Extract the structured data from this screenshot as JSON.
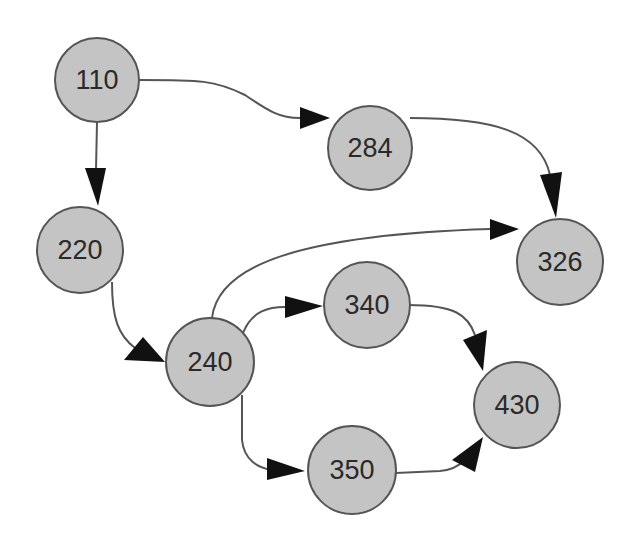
{
  "diagram": {
    "type": "directed-graph",
    "node_fill": "#c4c4c4",
    "node_stroke": "#555555",
    "arrow_color": "#111111",
    "nodes": [
      {
        "id": "n110",
        "label": "110",
        "cx": 97,
        "cy": 80,
        "r": 42
      },
      {
        "id": "n284",
        "label": "284",
        "cx": 370,
        "cy": 148,
        "r": 42
      },
      {
        "id": "n220",
        "label": "220",
        "cx": 80,
        "cy": 250,
        "r": 43
      },
      {
        "id": "n326",
        "label": "326",
        "cx": 560,
        "cy": 262,
        "r": 43
      },
      {
        "id": "n340",
        "label": "340",
        "cx": 367,
        "cy": 305,
        "r": 43
      },
      {
        "id": "n240",
        "label": "240",
        "cx": 210,
        "cy": 362,
        "r": 44
      },
      {
        "id": "n430",
        "label": "430",
        "cx": 517,
        "cy": 405,
        "r": 43
      },
      {
        "id": "n350",
        "label": "350",
        "cx": 352,
        "cy": 470,
        "r": 44
      }
    ],
    "edges": [
      {
        "from": "110",
        "to": "284"
      },
      {
        "from": "110",
        "to": "220"
      },
      {
        "from": "284",
        "to": "326"
      },
      {
        "from": "220",
        "to": "240"
      },
      {
        "from": "240",
        "to": "326"
      },
      {
        "from": "240",
        "to": "340"
      },
      {
        "from": "240",
        "to": "350"
      },
      {
        "from": "340",
        "to": "430"
      },
      {
        "from": "350",
        "to": "430"
      }
    ]
  }
}
